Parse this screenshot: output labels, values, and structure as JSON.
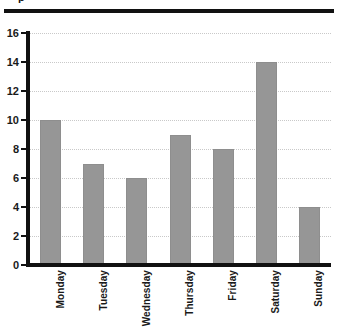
{
  "figure": {
    "title_fragment": "p",
    "background_color": "#ffffff",
    "rule_color": "#111111",
    "axis_color": "#111111",
    "gridline_color": "#c9c9c9",
    "bar_color": "#969696"
  },
  "chart_data": {
    "type": "bar",
    "title": "",
    "xlabel": "",
    "ylabel": "",
    "categories": [
      "Monday",
      "Tuesday",
      "Wednesday",
      "Thursday",
      "Friday",
      "Saturday",
      "Sunday"
    ],
    "values": [
      10,
      7,
      6,
      9,
      8,
      14,
      4
    ],
    "ylim": [
      0,
      16
    ],
    "ytick_labels": [
      "0",
      "2",
      "4",
      "6",
      "8",
      "10",
      "12",
      "14",
      "16"
    ],
    "ytick_values": [
      0,
      2,
      4,
      6,
      8,
      10,
      12,
      14,
      16
    ],
    "grid": true,
    "grid_axis": "y",
    "grid_style": "dotted",
    "legend": false,
    "legend_position": "none",
    "bar_color": "#969696",
    "orientation": "vertical",
    "xtick_label_rotation": 90
  }
}
